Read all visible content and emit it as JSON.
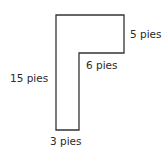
{
  "diagram": {
    "shape": "L-shape (inverted, Γ form)",
    "labels": {
      "right_side": "5 pies",
      "inner_step": "6 pies",
      "left_side": "15 pies",
      "bottom": "3 pies"
    },
    "stroke_color": "#333333"
  }
}
